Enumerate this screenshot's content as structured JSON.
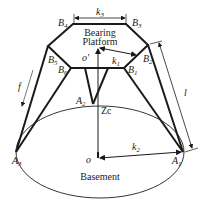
{
  "diagram": {
    "platform_label_line1": "Bearing",
    "platform_label_line2": "Platform",
    "base_label": "Basement",
    "points": {
      "B1": "B",
      "B1_sub": "1",
      "B2": "B",
      "B2_sub": "2",
      "B3": "B",
      "B3_sub": "3",
      "B4": "B",
      "B4_sub": "4",
      "B5": "B",
      "B5_sub": "5",
      "B6": "B",
      "B6_sub": "6",
      "A1": "A",
      "A1_sub": "1",
      "A2": "A",
      "A2_sub": "2",
      "A3": "A",
      "A3_sub": "3",
      "O_prime": "o′",
      "O": "o"
    },
    "dimensions": {
      "k1": "k",
      "k1_sub": "1",
      "k2": "k",
      "k2_sub": "2",
      "k3": "k",
      "k3_sub": "3",
      "l": "l",
      "f": "f",
      "Zc": "Zc"
    },
    "colors": {
      "line": "#1a1a1a",
      "thin": "#333333",
      "background": "#ffffff"
    }
  }
}
